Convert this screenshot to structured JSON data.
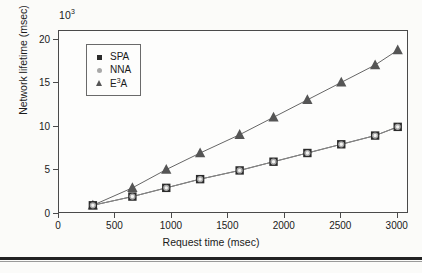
{
  "figure": {
    "background_color": "#fbfbf9",
    "frame_color": "#4a4a4a",
    "bottom_rule_color": "#232323"
  },
  "chart_data": {
    "type": "line",
    "title": "",
    "subtitle": "",
    "xlabel": "Request time (msec)",
    "ylabel": "Network lifetime (msec)",
    "y_multiplier_label": "10",
    "y_multiplier_exponent": "3",
    "xlim": [
      0,
      3100
    ],
    "ylim": [
      0,
      21
    ],
    "xticks": [
      0,
      500,
      1000,
      1500,
      2000,
      2500,
      3000
    ],
    "xticklabels": [
      "0",
      "500",
      "1000",
      "1500",
      "2000",
      "2500",
      "3000"
    ],
    "yticks": [
      0,
      5,
      10,
      15,
      20
    ],
    "yticklabels": [
      "0",
      "5",
      "10",
      "15",
      "20"
    ],
    "grid": false,
    "legend_position": "upper left",
    "x": [
      300,
      650,
      950,
      1250,
      1600,
      1900,
      2200,
      2500,
      2800,
      3000
    ],
    "series": [
      {
        "name": "SPA",
        "marker": "square",
        "color": "#2b2b2b",
        "values": [
          1,
          2,
          3,
          4,
          5,
          6,
          7,
          8,
          9,
          10
        ]
      },
      {
        "name": "NNA",
        "marker": "circle",
        "color": "#a8a8a8",
        "values": [
          1,
          2,
          3,
          4,
          5,
          6,
          7,
          8,
          9,
          10
        ]
      },
      {
        "name": "E3A",
        "marker": "triangle",
        "color": "#555555",
        "values": [
          1,
          3,
          5.1,
          7,
          9.1,
          11.1,
          13.1,
          15.1,
          17.1,
          18.8
        ]
      }
    ],
    "legend": [
      {
        "label_main": "SPA",
        "label_sup": "",
        "label_tail": "",
        "marker": "square"
      },
      {
        "label_main": "NNA",
        "label_sup": "",
        "label_tail": "",
        "marker": "circle"
      },
      {
        "label_main": "E",
        "label_sup": "3",
        "label_tail": "A",
        "marker": "triangle"
      }
    ],
    "annotations": []
  }
}
